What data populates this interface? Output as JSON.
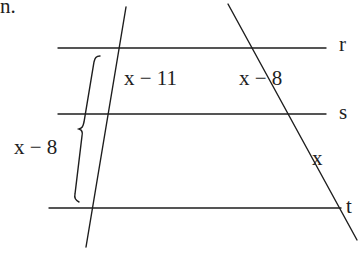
{
  "caption_fragment": "n.",
  "lines": {
    "parallel": [
      {
        "name": "r",
        "label": "r"
      },
      {
        "name": "s",
        "label": "s"
      },
      {
        "name": "t",
        "label": "t"
      }
    ],
    "transversals": [
      "left-transversal",
      "right-transversal"
    ]
  },
  "segments": {
    "left_rs": "x − 11",
    "right_rs": "x − 8",
    "right_st": "x",
    "left_rt_brace": "x − 8"
  },
  "colors": {
    "stroke": "#1e1e1e",
    "background": "#ffffff"
  }
}
